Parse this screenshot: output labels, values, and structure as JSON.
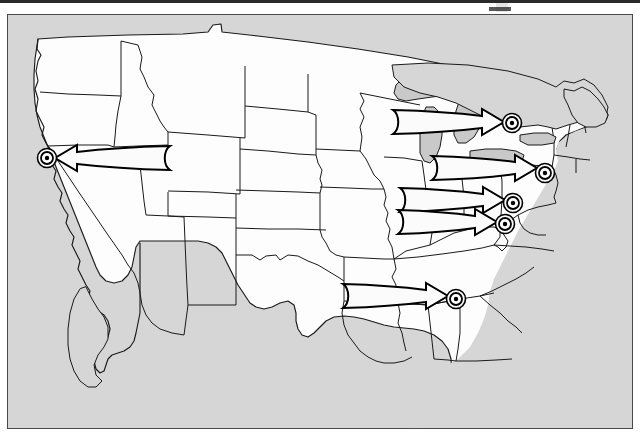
{
  "page": {
    "type": "map-figure",
    "title_text": "",
    "background_color": "#ffffff"
  },
  "map": {
    "name": "united-states-map",
    "projection_note": "contiguous United States, state outlines",
    "colors": {
      "ocean_background": "#d6d6d6",
      "land_fill": "#fdfdfd",
      "lake_fill": "#c9c9c9",
      "outline": "#1a1a1a",
      "frame": "#4a4a4a",
      "arrow_fill": "#fbfbfb",
      "arrow_stroke": "#000000",
      "marker_stroke": "#000000"
    },
    "frame": {
      "x": 7,
      "y": 14,
      "width": 626,
      "height": 415
    },
    "markers": [
      {
        "name": "target-marker-san-francisco",
        "label": "",
        "x": 47,
        "y": 158,
        "r_outer": 9.5,
        "r_mid": 6.0,
        "r_dot": 2.2
      },
      {
        "name": "target-marker-boston",
        "label": "",
        "x": 512,
        "y": 123,
        "r_outer": 9.5,
        "r_mid": 6.0,
        "r_dot": 2.2
      },
      {
        "name": "target-marker-new-york",
        "label": "",
        "x": 545,
        "y": 173,
        "r_outer": 9.5,
        "r_mid": 6.0,
        "r_dot": 2.2
      },
      {
        "name": "target-marker-baltimore",
        "label": "",
        "x": 513,
        "y": 203,
        "r_outer": 9.5,
        "r_mid": 6.0,
        "r_dot": 2.2
      },
      {
        "name": "target-marker-washington-dc",
        "label": "",
        "x": 505,
        "y": 224,
        "r_outer": 9.5,
        "r_mid": 6.0,
        "r_dot": 2.2
      },
      {
        "name": "target-marker-atlanta",
        "label": "",
        "x": 456,
        "y": 299,
        "r_outer": 9.5,
        "r_mid": 6.0,
        "r_dot": 2.2
      }
    ],
    "arrows": [
      {
        "name": "migration-arrow-to-san-francisco",
        "direction": "west",
        "tail_x": 170,
        "tip_x": 55,
        "tail_y": 158,
        "label": ""
      },
      {
        "name": "migration-arrow-to-boston",
        "direction": "east",
        "tail_x": 393,
        "tip_x": 504,
        "tail_y": 122,
        "label": ""
      },
      {
        "name": "migration-arrow-to-new-york",
        "direction": "east",
        "tail_x": 432,
        "tip_x": 537,
        "tail_y": 168,
        "label": ""
      },
      {
        "name": "migration-arrow-to-baltimore",
        "direction": "east",
        "tail_x": 400,
        "tip_x": 505,
        "tail_y": 200,
        "label": ""
      },
      {
        "name": "migration-arrow-to-washington-dc",
        "direction": "east",
        "tail_x": 398,
        "tip_x": 497,
        "tail_y": 222,
        "label": ""
      },
      {
        "name": "migration-arrow-to-atlanta",
        "direction": "east",
        "tail_x": 343,
        "tip_x": 448,
        "tail_y": 296,
        "label": ""
      }
    ],
    "arrow_count": 6,
    "marker_count": 6
  }
}
